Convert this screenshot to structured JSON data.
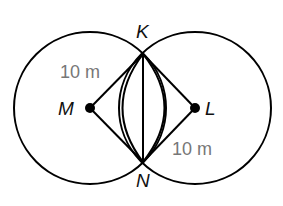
{
  "diagram": {
    "type": "geometry",
    "points": {
      "K": {
        "label": "K",
        "x": 143,
        "y": 54
      },
      "N": {
        "label": "N",
        "x": 143,
        "y": 162
      },
      "M": {
        "label": "M",
        "x": 90,
        "y": 108
      },
      "L": {
        "label": "L",
        "x": 195,
        "y": 108
      }
    },
    "circles": [
      {
        "center": "M",
        "radius_px": 76
      },
      {
        "center": "L",
        "radius_px": 76
      }
    ],
    "segments": [
      [
        "M",
        "K"
      ],
      [
        "M",
        "N"
      ],
      [
        "L",
        "K"
      ],
      [
        "L",
        "N"
      ],
      [
        "K",
        "N"
      ]
    ],
    "measurements": {
      "MK": "10 m",
      "LN": "10 m"
    },
    "colors": {
      "stroke": "#000000",
      "measurement_text": "#777777"
    }
  }
}
